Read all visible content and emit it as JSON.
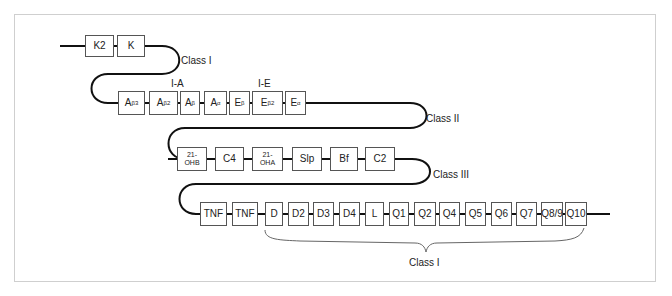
{
  "diagram": {
    "rows": [
      {
        "class_label": "Class I",
        "genes": [
          {
            "id": "K2",
            "label": "K2"
          },
          {
            "id": "K",
            "label": "K"
          }
        ]
      },
      {
        "class_label": "Class II",
        "group_labels": [
          "I-A",
          "I-E"
        ],
        "genes": [
          {
            "id": "Ab3",
            "base": "A",
            "sub": "β3"
          },
          {
            "id": "Ab2",
            "base": "A",
            "sub": "β2"
          },
          {
            "id": "Ab",
            "base": "A",
            "sub": "β"
          },
          {
            "id": "Aa",
            "base": "A",
            "sub": "α"
          },
          {
            "id": "Eb",
            "base": "E",
            "sub": "β"
          },
          {
            "id": "Eb2",
            "base": "E",
            "sub": "β2"
          },
          {
            "id": "Ea",
            "base": "E",
            "sub": "α"
          }
        ]
      },
      {
        "class_label": "Class III",
        "genes": [
          {
            "id": "21-OHB",
            "line1": "21-",
            "line2": "OHB"
          },
          {
            "id": "C4",
            "label": "C4"
          },
          {
            "id": "21-OHA",
            "line1": "21-",
            "line2": "OHA"
          },
          {
            "id": "Slp",
            "label": "Slp"
          },
          {
            "id": "Bf",
            "label": "Bf"
          },
          {
            "id": "C2",
            "label": "C2"
          }
        ]
      },
      {
        "class_label": "Class I",
        "genes": [
          {
            "id": "TNF1",
            "label": "TNF"
          },
          {
            "id": "TNF2",
            "label": "TNF"
          },
          {
            "id": "D",
            "label": "D"
          },
          {
            "id": "D2",
            "label": "D2"
          },
          {
            "id": "D3",
            "label": "D3"
          },
          {
            "id": "D4",
            "label": "D4"
          },
          {
            "id": "L",
            "label": "L"
          },
          {
            "id": "Q1",
            "label": "Q1"
          },
          {
            "id": "Q2",
            "label": "Q2"
          },
          {
            "id": "Q4",
            "label": "Q4"
          },
          {
            "id": "Q5",
            "label": "Q5"
          },
          {
            "id": "Q6",
            "label": "Q6"
          },
          {
            "id": "Q7",
            "label": "Q7"
          },
          {
            "id": "Q8/9",
            "label": "Q8/9"
          },
          {
            "id": "Q10",
            "label": "Q10"
          }
        ]
      }
    ],
    "colors": {
      "wire": "#111111",
      "box_border": "#555555",
      "frame": "#cfcfcf",
      "brace": "#666666"
    }
  }
}
